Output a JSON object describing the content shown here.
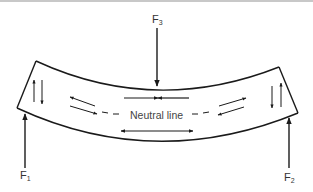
{
  "diagram": {
    "labels": {
      "neutral_line": "Neutral line",
      "f1": "F",
      "f1_sub": "1",
      "f2": "F",
      "f2_sub": "2",
      "f3": "F",
      "f3_sub": "3"
    },
    "forces": [
      {
        "name": "F1",
        "direction": "up",
        "position": "left-end-bottom"
      },
      {
        "name": "F2",
        "direction": "up",
        "position": "right-end-bottom"
      },
      {
        "name": "F3",
        "direction": "down",
        "position": "center-top"
      }
    ],
    "internal_stresses": {
      "top_center": "compression",
      "bottom_center": "tension",
      "left_end": "shear",
      "right_end": "shear",
      "near_neutral_line": "shear"
    },
    "colors": {
      "stroke": "#1a1a1a",
      "text": "#333333",
      "background": "#ffffff",
      "top_border": "#c8c8c8"
    }
  }
}
